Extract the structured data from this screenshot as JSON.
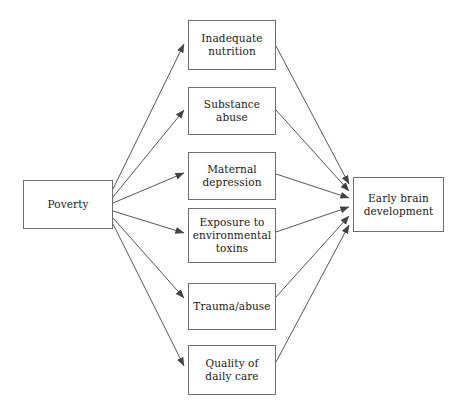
{
  "diagram": {
    "background_color": "#ffffff",
    "line_color": "#444444",
    "border_color": "#6e6e6e",
    "text_color": "#1a1a1a",
    "source_node": {
      "id": "poverty",
      "label": "Poverty",
      "x": 23,
      "y": 180,
      "width": 90,
      "height": 49
    },
    "mediator_nodes": [
      {
        "id": "inadequate-nutrition",
        "label": "Inadequate\nnutrition",
        "x": 188,
        "y": 20,
        "width": 88,
        "height": 50
      },
      {
        "id": "substance-abuse",
        "label": "Substance\nabuse",
        "x": 188,
        "y": 87,
        "width": 88,
        "height": 48
      },
      {
        "id": "maternal-depression",
        "label": "Maternal\ndepression",
        "x": 188,
        "y": 152,
        "width": 88,
        "height": 48
      },
      {
        "id": "environmental-toxins",
        "label": "Exposure to\nenvironmental\ntoxins",
        "x": 188,
        "y": 208,
        "width": 88,
        "height": 55
      },
      {
        "id": "trauma-abuse",
        "label": "Trauma/abuse",
        "x": 188,
        "y": 283,
        "width": 88,
        "height": 47
      },
      {
        "id": "quality-daily-care",
        "label": "Quality of\ndaily care",
        "x": 188,
        "y": 345,
        "width": 88,
        "height": 50
      }
    ],
    "outcome_node": {
      "id": "early-brain-development",
      "label": "Early brain\ndevelopment",
      "x": 353,
      "y": 177,
      "width": 91,
      "height": 55
    },
    "edges_from_source": [
      {
        "from": "poverty",
        "to": "inadequate-nutrition"
      },
      {
        "from": "poverty",
        "to": "substance-abuse"
      },
      {
        "from": "poverty",
        "to": "maternal-depression"
      },
      {
        "from": "poverty",
        "to": "environmental-toxins"
      },
      {
        "from": "poverty",
        "to": "trauma-abuse"
      },
      {
        "from": "poverty",
        "to": "quality-daily-care"
      }
    ],
    "edges_to_outcome": [
      {
        "from": "inadequate-nutrition",
        "to": "early-brain-development"
      },
      {
        "from": "substance-abuse",
        "to": "early-brain-development"
      },
      {
        "from": "maternal-depression",
        "to": "early-brain-development"
      },
      {
        "from": "environmental-toxins",
        "to": "early-brain-development"
      },
      {
        "from": "trauma-abuse",
        "to": "early-brain-development"
      },
      {
        "from": "quality-daily-care",
        "to": "early-brain-development"
      }
    ]
  }
}
